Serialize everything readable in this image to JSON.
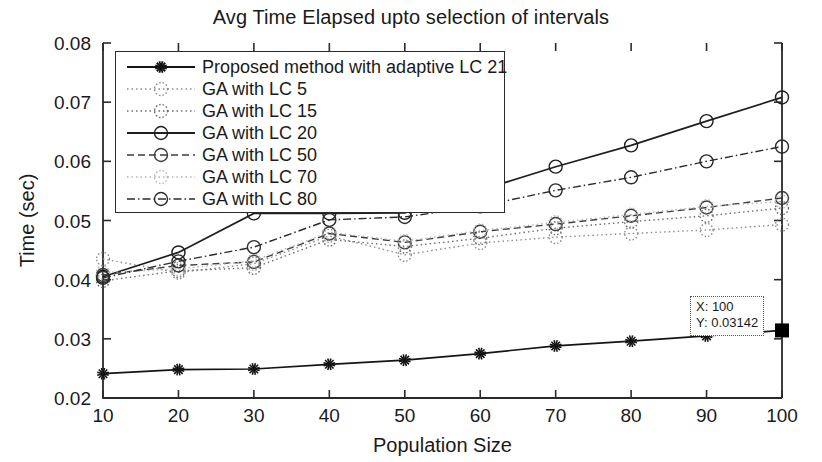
{
  "chart_data": {
    "type": "line",
    "title": "Avg Time Elapsed upto selection of intervals",
    "xlabel": "Population Size",
    "ylabel": "Time (sec)",
    "x": [
      10,
      20,
      30,
      40,
      50,
      60,
      70,
      80,
      90,
      100
    ],
    "xlim": [
      10,
      100
    ],
    "ylim": [
      0.02,
      0.08
    ],
    "xticks": [
      "10",
      "20",
      "30",
      "40",
      "50",
      "60",
      "70",
      "80",
      "90",
      "100"
    ],
    "yticks": [
      "0.02",
      "0.03",
      "0.04",
      "0.05",
      "0.06",
      "0.07",
      "0.08"
    ],
    "grid": false,
    "legend_position": "upper left",
    "series": [
      {
        "name": "Proposed method with adaptive LC 21",
        "marker": "star",
        "linestyle": "solid",
        "color": "#141414",
        "values": [
          0.0241,
          0.0248,
          0.0249,
          0.0257,
          0.0264,
          0.0275,
          0.0288,
          0.0296,
          0.0305,
          0.03142
        ]
      },
      {
        "name": "GA with LC 5",
        "marker": "circle",
        "linestyle": "dotted",
        "color": "#8e8e8e",
        "values": [
          0.0435,
          0.0412,
          0.0427,
          0.0474,
          0.0442,
          0.0462,
          0.0472,
          0.0478,
          0.0484,
          0.0493
        ]
      },
      {
        "name": "GA with LC 15",
        "marker": "circle",
        "linestyle": "dotted",
        "color": "#6e6e6e",
        "values": [
          0.0398,
          0.0415,
          0.042,
          0.0468,
          0.0456,
          0.047,
          0.0487,
          0.0498,
          0.0508,
          0.0521
        ]
      },
      {
        "name": "GA with LC 20",
        "marker": "circle",
        "linestyle": "solid",
        "color": "#1f1f1f",
        "values": [
          0.0405,
          0.0446,
          0.0512,
          0.0512,
          0.0513,
          0.0551,
          0.0591,
          0.0627,
          0.0668,
          0.0708
        ]
      },
      {
        "name": "GA with LC 50",
        "marker": "circle",
        "linestyle": "dashed",
        "color": "#3d3d3d",
        "values": [
          0.0408,
          0.0424,
          0.043,
          0.0478,
          0.0463,
          0.0481,
          0.0494,
          0.0508,
          0.0522,
          0.0538
        ]
      },
      {
        "name": "GA with LC 70",
        "marker": "circle",
        "linestyle": "dotted",
        "color": "#b4b4b4",
        "values": [
          0.0412,
          0.0418,
          0.0432,
          0.048,
          0.0465,
          0.0483,
          0.0497,
          0.051,
          0.0524,
          0.0532
        ]
      },
      {
        "name": "GA with LC 80",
        "marker": "circle",
        "linestyle": "dashdot",
        "color": "#2b2b2b",
        "values": [
          0.0403,
          0.0431,
          0.0455,
          0.0501,
          0.0506,
          0.0524,
          0.0551,
          0.0573,
          0.06,
          0.0625
        ]
      }
    ],
    "datatip": {
      "x_label": "X: 100",
      "y_label": "Y: 0.03142",
      "x_value": 100,
      "y_value": 0.03142
    }
  }
}
